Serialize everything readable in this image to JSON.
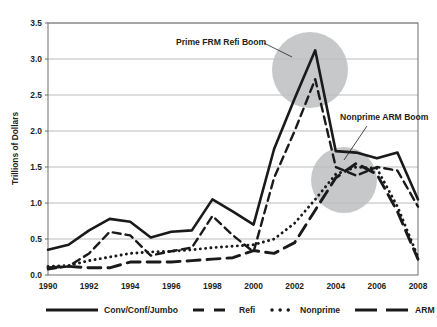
{
  "chart_data": {
    "type": "line",
    "title": "",
    "xlabel": "",
    "ylabel": "Trillions of Dollars",
    "xlim": [
      1990,
      2008
    ],
    "ylim": [
      0.0,
      3.5
    ],
    "grid": true,
    "legend_position": "bottom",
    "x": [
      1990,
      1991,
      1992,
      1993,
      1994,
      1995,
      1996,
      1997,
      1998,
      1999,
      2000,
      2001,
      2002,
      2003,
      2004,
      2005,
      2006,
      2007,
      2008
    ],
    "xtick_labels": [
      "1990",
      "1992",
      "1994",
      "1996",
      "1998",
      "2000",
      "2002",
      "2004",
      "2006",
      "2008"
    ],
    "xtick_values": [
      1990,
      1992,
      1994,
      1996,
      1998,
      2000,
      2002,
      2004,
      2006,
      2008
    ],
    "ytick_labels": [
      "0.0",
      "0.5",
      "1.0",
      "1.5",
      "2.0",
      "2.5",
      "3.0",
      "3.5"
    ],
    "ytick_values": [
      0.0,
      0.5,
      1.0,
      1.5,
      2.0,
      2.5,
      3.0,
      3.5
    ],
    "series": [
      {
        "name": "Conv/Conf/Jumbo",
        "style": "solid",
        "values": [
          0.35,
          0.42,
          0.62,
          0.78,
          0.74,
          0.52,
          0.6,
          0.62,
          1.05,
          0.88,
          0.7,
          1.75,
          2.45,
          3.12,
          1.72,
          1.7,
          1.62,
          1.7,
          1.05
        ]
      },
      {
        "name": "Refi",
        "style": "dashed",
        "values": [
          0.08,
          0.12,
          0.3,
          0.6,
          0.55,
          0.27,
          0.33,
          0.38,
          0.82,
          0.55,
          0.32,
          1.35,
          2.0,
          2.72,
          1.5,
          1.38,
          1.5,
          1.45,
          0.95
        ]
      },
      {
        "name": "Nonprime",
        "style": "dotted",
        "values": [
          0.12,
          0.13,
          0.2,
          0.25,
          0.3,
          0.32,
          0.33,
          0.35,
          0.38,
          0.4,
          0.42,
          0.5,
          0.72,
          1.05,
          1.4,
          1.5,
          1.48,
          0.95,
          0.25
        ]
      },
      {
        "name": "ARM",
        "style": "longdash",
        "values": [
          0.1,
          0.12,
          0.1,
          0.1,
          0.18,
          0.18,
          0.18,
          0.2,
          0.22,
          0.24,
          0.34,
          0.3,
          0.45,
          0.9,
          1.35,
          1.55,
          1.4,
          0.88,
          0.22
        ]
      }
    ],
    "annotations": [
      {
        "text": "Prime FRM Refi Boom",
        "target_x": 2003,
        "target_y": 3.1,
        "highlight": "circle"
      },
      {
        "text": "Nonprime ARM Boom",
        "target_x": 2005,
        "target_y": 1.45,
        "highlight": "circle"
      }
    ]
  },
  "legend": {
    "items": [
      {
        "label": "Conv/Conf/Jumbo",
        "style": "solid"
      },
      {
        "label": "Refi",
        "style": "dashed"
      },
      {
        "label": "Nonprime",
        "style": "dotted"
      },
      {
        "label": "ARM",
        "style": "longdash"
      }
    ]
  },
  "colors": {
    "line": "#1a1a1a",
    "grid": "#a7a9ac",
    "axis": "#6d6e71",
    "highlight": "#bcbec0",
    "text": "#231f20",
    "background": "#ffffff"
  }
}
